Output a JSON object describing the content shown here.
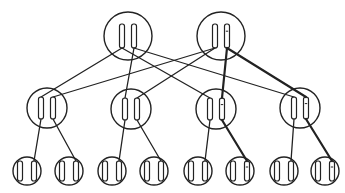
{
  "diagram": {
    "type": "tree",
    "colors": {
      "stroke": "#222222",
      "background": "#ffffff"
    },
    "levels": [
      {
        "name": "top",
        "radius": 24,
        "bar": {
          "w": 5,
          "h": 24
        },
        "nodes": [
          {
            "id": "T1",
            "cx": 128,
            "cy": 36,
            "bars": [
              {
                "dx": -6,
                "marked": false
              },
              {
                "dx": 6,
                "marked": false
              }
            ]
          },
          {
            "id": "T2",
            "cx": 221,
            "cy": 36,
            "bars": [
              {
                "dx": -6,
                "marked": false
              },
              {
                "dx": 6,
                "marked": true
              }
            ]
          }
        ]
      },
      {
        "name": "middle",
        "radius": 20,
        "bar": {
          "w": 5,
          "h": 22
        },
        "nodes": [
          {
            "id": "M1",
            "cx": 47,
            "cy": 108,
            "bars": [
              {
                "dx": -6,
                "marked": false
              },
              {
                "dx": 6,
                "marked": false
              }
            ]
          },
          {
            "id": "M2",
            "cx": 131,
            "cy": 109,
            "bars": [
              {
                "dx": -6,
                "marked": false
              },
              {
                "dx": 6,
                "marked": false
              }
            ]
          },
          {
            "id": "M3",
            "cx": 216,
            "cy": 109,
            "bars": [
              {
                "dx": -6,
                "marked": false
              },
              {
                "dx": 6,
                "marked": true
              }
            ]
          },
          {
            "id": "M4",
            "cx": 300,
            "cy": 108,
            "bars": [
              {
                "dx": -6,
                "marked": false
              },
              {
                "dx": 6,
                "marked": true
              }
            ]
          }
        ]
      },
      {
        "name": "bottom",
        "radius": 14,
        "bar": {
          "w": 5,
          "h": 20
        },
        "nodes": [
          {
            "id": "B1",
            "cx": 27,
            "cy": 171,
            "bars": [
              {
                "dx": -7,
                "marked": false
              },
              {
                "dx": 7,
                "marked": false
              }
            ]
          },
          {
            "id": "B2",
            "cx": 69,
            "cy": 171,
            "bars": [
              {
                "dx": -7,
                "marked": false
              },
              {
                "dx": 7,
                "marked": false
              }
            ]
          },
          {
            "id": "B3",
            "cx": 112,
            "cy": 171,
            "bars": [
              {
                "dx": -7,
                "marked": false
              },
              {
                "dx": 7,
                "marked": false
              }
            ]
          },
          {
            "id": "B4",
            "cx": 154,
            "cy": 171,
            "bars": [
              {
                "dx": -7,
                "marked": false
              },
              {
                "dx": 7,
                "marked": false
              }
            ]
          },
          {
            "id": "B5",
            "cx": 198,
            "cy": 171,
            "bars": [
              {
                "dx": -7,
                "marked": false
              },
              {
                "dx": 7,
                "marked": false
              }
            ]
          },
          {
            "id": "B6",
            "cx": 240,
            "cy": 171,
            "bars": [
              {
                "dx": -7,
                "marked": false
              },
              {
                "dx": 7,
                "marked": true
              }
            ]
          },
          {
            "id": "B7",
            "cx": 284,
            "cy": 171,
            "bars": [
              {
                "dx": -7,
                "marked": false
              },
              {
                "dx": 7,
                "marked": false
              }
            ]
          },
          {
            "id": "B8",
            "cx": 325,
            "cy": 171,
            "bars": [
              {
                "dx": -7,
                "marked": false
              },
              {
                "dx": 7,
                "marked": true
              }
            ]
          }
        ]
      }
    ],
    "edges": [
      {
        "from": "T1.0",
        "to": "M1.0",
        "bold": false
      },
      {
        "from": "T1.0",
        "to": "M3.0",
        "bold": false
      },
      {
        "from": "T1.1",
        "to": "M2.0",
        "bold": false
      },
      {
        "from": "T1.1",
        "to": "M4.0",
        "bold": false
      },
      {
        "from": "T2.0",
        "to": "M1.1",
        "bold": false
      },
      {
        "from": "T2.0",
        "to": "M2.1",
        "bold": false
      },
      {
        "from": "T2.1",
        "to": "M3.1",
        "bold": true
      },
      {
        "from": "T2.1",
        "to": "M4.1",
        "bold": true
      },
      {
        "from": "M1.0",
        "to": "B1.1",
        "bold": false
      },
      {
        "from": "M1.1",
        "to": "B2.1",
        "bold": false
      },
      {
        "from": "M2.0",
        "to": "B3.1",
        "bold": false
      },
      {
        "from": "M2.1",
        "to": "B4.1",
        "bold": false
      },
      {
        "from": "M3.0",
        "to": "B5.1",
        "bold": false
      },
      {
        "from": "M3.1",
        "to": "B6.1",
        "bold": true
      },
      {
        "from": "M4.0",
        "to": "B7.1",
        "bold": false
      },
      {
        "from": "M4.1",
        "to": "B8.1",
        "bold": true
      }
    ]
  }
}
